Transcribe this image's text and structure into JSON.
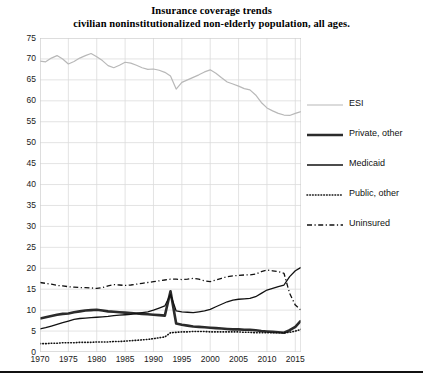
{
  "title": {
    "line1": "Insurance coverage trends",
    "line2": "civilian noninstitutionalized non-elderly population, all ages."
  },
  "legend": {
    "position": "right",
    "items": [
      {
        "label": "ESI",
        "style": "solid-thin-gray",
        "color": "#b8b8b8"
      },
      {
        "label": "Private, other",
        "style": "solid-thick-black",
        "color": "#2b2b2b"
      },
      {
        "label": "Medicaid",
        "style": "solid-medium-black",
        "color": "#111111"
      },
      {
        "label": "Public, other",
        "style": "dotted-black",
        "color": "#111111"
      },
      {
        "label": "Uninsured",
        "style": "dash-dot-black",
        "color": "#111111"
      }
    ]
  },
  "axes": {
    "y_ticks": [
      0,
      5,
      10,
      15,
      20,
      25,
      30,
      35,
      40,
      45,
      50,
      55,
      60,
      65,
      70,
      75
    ],
    "x_ticks": [
      1970,
      1975,
      1980,
      1985,
      1990,
      1995,
      2000,
      2005,
      2010,
      2015
    ],
    "ylim": [
      0,
      75
    ],
    "xlim": [
      1970,
      2016
    ],
    "grid": true
  },
  "chart_data": {
    "type": "line",
    "xlabel": "",
    "ylabel": "",
    "ylim": [
      0,
      75
    ],
    "xlim": [
      1970,
      2016
    ],
    "grid": true,
    "legend_position": "right",
    "x": [
      1970,
      1971,
      1972,
      1973,
      1974,
      1975,
      1976,
      1977,
      1978,
      1979,
      1980,
      1981,
      1982,
      1983,
      1984,
      1985,
      1986,
      1987,
      1988,
      1989,
      1990,
      1991,
      1992,
      1993,
      1994,
      1995,
      1996,
      1997,
      1998,
      1999,
      2000,
      2001,
      2002,
      2003,
      2004,
      2005,
      2006,
      2007,
      2008,
      2009,
      2010,
      2011,
      2012,
      2013,
      2014,
      2015,
      2016
    ],
    "series": [
      {
        "name": "ESI",
        "style": "solid-thin-gray",
        "color": "#b8b8b8",
        "values": [
          69.5,
          69.3,
          70.2,
          70.8,
          70.0,
          68.8,
          69.4,
          70.2,
          70.8,
          71.3,
          70.5,
          69.6,
          68.4,
          67.9,
          68.5,
          69.2,
          69.0,
          68.5,
          67.9,
          67.5,
          67.6,
          67.3,
          66.8,
          65.9,
          62.8,
          64.4,
          65.0,
          65.6,
          66.2,
          66.9,
          67.4,
          66.6,
          65.5,
          64.5,
          64.0,
          63.5,
          62.9,
          62.6,
          61.4,
          59.6,
          58.3,
          57.6,
          57.0,
          56.6,
          56.5,
          57.0,
          57.4
        ]
      },
      {
        "name": "Private, other",
        "style": "solid-thick-black",
        "color": "#2b2b2b",
        "values": [
          8.0,
          8.3,
          8.6,
          8.9,
          9.1,
          9.2,
          9.5,
          9.7,
          9.9,
          10.0,
          10.1,
          9.9,
          9.7,
          9.6,
          9.5,
          9.4,
          9.3,
          9.2,
          9.1,
          9.0,
          8.9,
          8.8,
          8.7,
          14.5,
          6.8,
          6.5,
          6.3,
          6.1,
          6.0,
          5.9,
          5.8,
          5.7,
          5.6,
          5.5,
          5.4,
          5.4,
          5.3,
          5.3,
          5.2,
          5.0,
          4.9,
          4.8,
          4.7,
          4.6,
          5.2,
          6.0,
          7.5
        ]
      },
      {
        "name": "Medicaid",
        "style": "solid-medium-black",
        "color": "#111111",
        "values": [
          5.5,
          5.8,
          6.2,
          6.6,
          7.0,
          7.4,
          7.8,
          8.0,
          8.1,
          8.2,
          8.3,
          8.4,
          8.5,
          8.7,
          8.8,
          8.9,
          9.0,
          9.2,
          9.4,
          9.6,
          10.0,
          10.5,
          11.0,
          13.8,
          9.8,
          9.6,
          9.5,
          9.4,
          9.6,
          9.8,
          10.2,
          10.8,
          11.4,
          12.0,
          12.4,
          12.6,
          12.7,
          12.8,
          13.2,
          14.0,
          14.8,
          15.2,
          15.6,
          16.0,
          18.0,
          19.4,
          20.2
        ]
      },
      {
        "name": "Public, other",
        "style": "dotted-black",
        "color": "#111111",
        "values": [
          2.0,
          2.0,
          2.1,
          2.1,
          2.2,
          2.2,
          2.2,
          2.3,
          2.3,
          2.3,
          2.4,
          2.4,
          2.4,
          2.5,
          2.5,
          2.6,
          2.7,
          2.8,
          2.9,
          3.0,
          3.2,
          3.4,
          3.6,
          4.6,
          4.7,
          4.8,
          4.8,
          4.9,
          4.9,
          4.9,
          4.8,
          4.8,
          4.8,
          4.8,
          4.8,
          4.8,
          4.7,
          4.7,
          4.6,
          4.6,
          4.6,
          4.6,
          4.6,
          4.6,
          4.7,
          5.0,
          5.4
        ]
      },
      {
        "name": "Uninsured",
        "style": "dash-dot-black",
        "color": "#111111",
        "values": [
          16.6,
          16.4,
          16.2,
          15.9,
          15.8,
          15.6,
          15.5,
          15.4,
          15.4,
          15.3,
          15.2,
          15.4,
          15.8,
          16.1,
          16.0,
          15.9,
          16.0,
          16.2,
          16.4,
          16.6,
          16.8,
          17.0,
          17.2,
          17.4,
          17.4,
          17.3,
          17.4,
          17.6,
          17.4,
          17.0,
          16.8,
          17.2,
          17.6,
          18.0,
          18.2,
          18.3,
          18.4,
          18.4,
          18.6,
          19.2,
          19.6,
          19.4,
          19.2,
          18.8,
          14.0,
          11.2,
          10.0
        ]
      }
    ]
  }
}
